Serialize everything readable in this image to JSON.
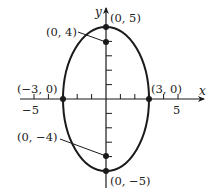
{
  "diagram": {
    "type": "ellipse-graph",
    "equation_params": {
      "a": 3,
      "b": 5,
      "center": [
        0,
        0
      ]
    },
    "axes": {
      "x_label": "x",
      "y_label": "y",
      "x_tick_labels": [
        {
          "value": -5,
          "text": "−5"
        },
        {
          "value": 5,
          "text": "5"
        }
      ],
      "x_ticks": [
        -5,
        -4,
        -3,
        -2,
        -1,
        1,
        2,
        3,
        4,
        5
      ],
      "y_ticks": [
        -4,
        -3,
        -2,
        -1,
        1,
        2,
        3,
        4
      ]
    },
    "points": [
      {
        "id": "vertex-top",
        "x": 0,
        "y": 5,
        "label": "(0, 5)"
      },
      {
        "id": "focus-top",
        "x": 0,
        "y": 4,
        "label": "(0, 4)"
      },
      {
        "id": "covertex-left",
        "x": -3,
        "y": 0,
        "label": "(−3, 0)"
      },
      {
        "id": "covertex-right",
        "x": 3,
        "y": 0,
        "label": "(3, 0)"
      },
      {
        "id": "focus-bottom",
        "x": 0,
        "y": -4,
        "label": "(0, −4)"
      },
      {
        "id": "vertex-bottom",
        "x": 0,
        "y": -5,
        "label": "(0, −5)"
      }
    ],
    "colors": {
      "stroke": "#1a1a1a",
      "background": "#ffffff"
    }
  }
}
